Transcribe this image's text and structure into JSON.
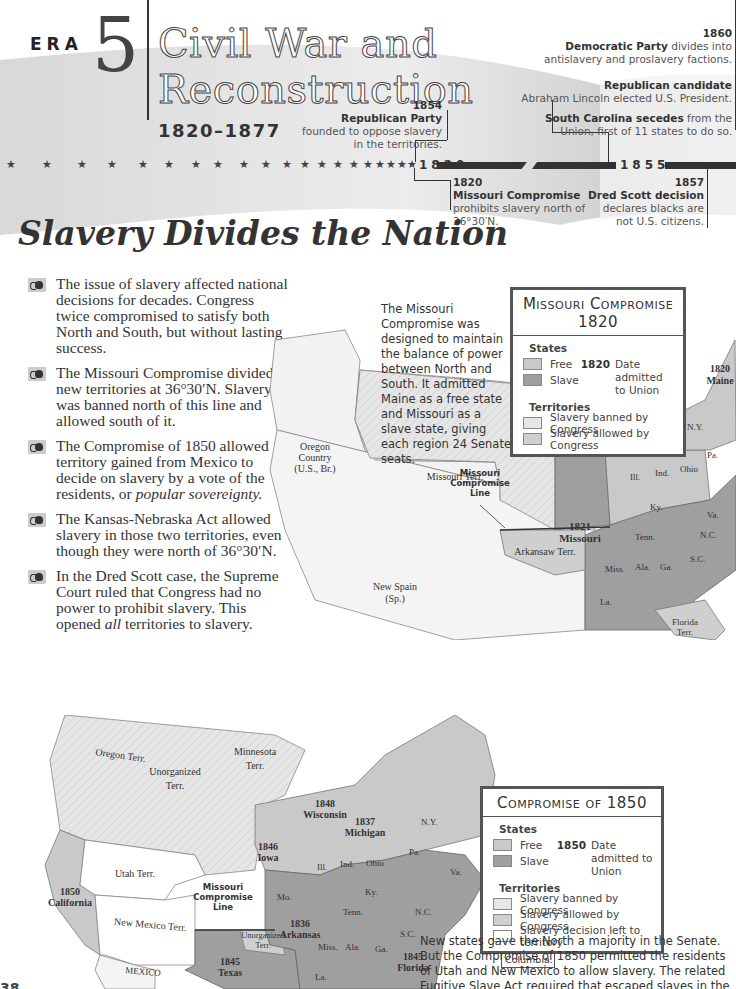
{
  "banner": {
    "era_label": "ERA",
    "era_number": "5",
    "title_line1": "Civil War and",
    "title_line2": "Reconstruction",
    "years": "1820–1877"
  },
  "timeline": {
    "start_year": "1820",
    "mid_year": "1855",
    "events": [
      {
        "year": "1820",
        "headline": "Missouri Compromise",
        "text": "prohibits slavery north of 36°30′N."
      },
      {
        "year": "1854",
        "headline": "Republican Party",
        "text_line1": "founded to oppose slavery",
        "text_line2": "in the territories."
      },
      {
        "year": "1857",
        "headline": "Dred Scott decision",
        "text_line1": "declares blacks are",
        "text_line2": "not U.S. citizens."
      },
      {
        "year": "1860",
        "headline": "Democratic Party",
        "text_inline": " divides into",
        "text_line2": "antislavery and proslavery factions."
      },
      {
        "headline": "Republican candidate",
        "text": "Abraham Lincoln elected U.S. President."
      },
      {
        "headline": "South Carolina secedes",
        "text_inline": " from the",
        "text_line2": "Union, first of 11 states to do so."
      }
    ]
  },
  "section": {
    "title": "Slavery Divides the Nation",
    "bullets": [
      {
        "text": "The issue of slavery affected national decisions for decades. Congress twice compromised to satisfy both North and South, but without lasting success."
      },
      {
        "text": "The Missouri Compromise divided new territories at 36°30′N. Slavery was banned north of this line and allowed south of it."
      },
      {
        "text_before": "The Compromise of 1850 allowed territory gained from Mexico to decide on slavery by a vote of the residents, or ",
        "emphasis": "popular sovereignty.",
        "text_after": ""
      },
      {
        "text": "The Kansas-Nebraska Act allowed slavery in those two territories, even though they were north of 36°30′N."
      },
      {
        "text_before": "In the Dred Scott case, the Supreme Court ruled that Congress had no power to prohibit slavery. This opened ",
        "emphasis": "all",
        "text_after": " territories to slavery."
      }
    ]
  },
  "captions": {
    "missouri": "The Missouri Compromise was designed to maintain the balance of power between North and South. It admitted Maine as a free state and Missouri as a slave state, giving each region 24 Senate seats.",
    "compromise_1850": "New states gave the North a majority in the Senate. But the Compromise of 1850 permitted the residents of Utah and New Mexico to allow slavery. The related Fugitive Slave Act required that escaped slaves in the North be returned to"
  },
  "legend_1820": {
    "title_line1": "Missouri Compromise",
    "title_line2": "1820",
    "states_label": "States",
    "free": "Free",
    "slave": "Slave",
    "date_sample": "1820",
    "date_text": "Date admitted to Union",
    "territories_label": "Territories",
    "banned": "Slavery banned by Congress",
    "allowed": "Slavery allowed by Congress"
  },
  "legend_1850": {
    "title": "Compromise of 1850",
    "states_label": "States",
    "free": "Free",
    "slave": "Slave",
    "date_sample": "1850",
    "date_text": "Date admitted to Union",
    "territories_label": "Territories",
    "banned": "Slavery banned by Congress",
    "allowed": "Slavery allowed by Congress",
    "left": "Slavery decision left to territory"
  },
  "map_1820": {
    "labels": {
      "oregon": [
        "Oregon",
        "Country",
        "(U.S., Br.)"
      ],
      "missouri_terr": "Missouri Terr.",
      "michigan_terr": "Michigan Terr.",
      "compromise_line": [
        "Missouri",
        "Compromise",
        "Line"
      ],
      "missouri": [
        "1821",
        "Missouri"
      ],
      "new_spain": [
        "New Spain",
        "(Sp.)"
      ],
      "arkansaw": "Arkansaw Terr.",
      "florida": [
        "Florida",
        "Terr."
      ],
      "maine": [
        "1820",
        "Maine"
      ],
      "states": [
        "Ill.",
        "Ind.",
        "Ohio",
        "Pa.",
        "N.Y.",
        "Vt.",
        "N.H.",
        "Mass.",
        "Conn.",
        "R.I.",
        "N.J.",
        "Del.",
        "Md.",
        "Va.",
        "Ky.",
        "Tenn.",
        "N.C.",
        "S.C.",
        "Ga.",
        "Ala.",
        "Miss.",
        "La."
      ]
    }
  },
  "map_1850": {
    "labels": {
      "oregon": "Oregon Terr.",
      "unorganized": [
        "Unorganized",
        "Terr."
      ],
      "minnesota": [
        "Minnesota",
        "Terr."
      ],
      "utah": "Utah Terr.",
      "new_mexico": "New Mexico Terr.",
      "mexico": "MEXICO",
      "california": [
        "1850",
        "California"
      ],
      "iowa": [
        "1846",
        "Iowa"
      ],
      "wisconsin": [
        "1848",
        "Wisconsin"
      ],
      "michigan": [
        "1837",
        "Michigan"
      ],
      "arkansas": [
        "1836",
        "Arkansas"
      ],
      "texas": [
        "1845",
        "Texas"
      ],
      "florida": [
        "1845",
        "Florida"
      ],
      "compromise_line": [
        "Missouri",
        "Compromise",
        "Line"
      ],
      "unorg_south": [
        "Unorganized",
        "Terr."
      ],
      "states": [
        "Mo.",
        "Ill.",
        "Ind.",
        "Ohio",
        "Pa.",
        "N.Y.",
        "Vt.",
        "N.H.",
        "Maine",
        "Mass.",
        "Conn.",
        "R.I.",
        "N.J.",
        "Del.",
        "Md.",
        "Va.",
        "Ky.",
        "Tenn.",
        "N.C.",
        "S.C.",
        "Ga.",
        "Ala.",
        "Miss.",
        "La."
      ]
    },
    "dc_callout": [
      "Slave trade",
      "banned in",
      "District of",
      "Columbia."
    ]
  },
  "colors": {
    "free": "#c9c9c9",
    "slave": "#9a9a9a",
    "banned": "#e4e4e4",
    "allowed": "#cfcfcf",
    "left": "#ffffff",
    "ink": "#333333"
  },
  "page_number": "38"
}
